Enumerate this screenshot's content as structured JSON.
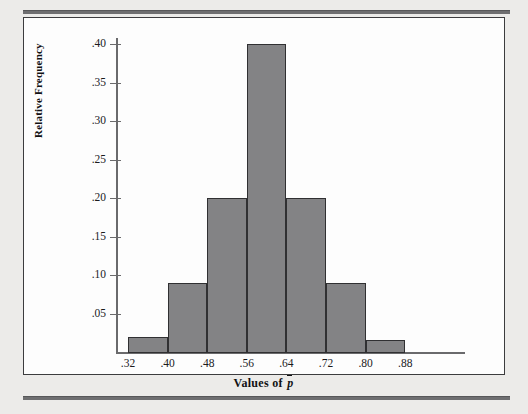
{
  "figure": {
    "panel_background": "#fdfdfd",
    "page_background": "#ecebe9",
    "bar_fill": "#838385",
    "bar_stroke": "#303032",
    "axis_color": "#6a6a6c"
  },
  "chart_data": {
    "type": "bar",
    "title": "",
    "subtitle": "",
    "xlabel": "Values of p̄",
    "ylabel": "Relative Frequency",
    "grid": false,
    "legend": null,
    "xlim": [
      0.24,
      0.92
    ],
    "ylim": [
      0.0,
      0.43
    ],
    "x_tick_labels": [
      ".32",
      ".40",
      ".48",
      ".56",
      ".64",
      ".72",
      ".80",
      ".88"
    ],
    "x_tick_values": [
      0.32,
      0.4,
      0.48,
      0.56,
      0.64,
      0.72,
      0.8,
      0.88
    ],
    "y_tick_labels": [
      ".05",
      ".10",
      ".15",
      ".20",
      ".25",
      ".30",
      ".35",
      ".40"
    ],
    "y_tick_values": [
      0.05,
      0.1,
      0.15,
      0.2,
      0.25,
      0.3,
      0.35,
      0.4
    ],
    "bin_width": 0.08,
    "bins": [
      {
        "left": 0.32,
        "right": 0.4,
        "center": 0.36,
        "value": 0.02
      },
      {
        "left": 0.4,
        "right": 0.48,
        "center": 0.44,
        "value": 0.09
      },
      {
        "left": 0.48,
        "right": 0.56,
        "center": 0.52,
        "value": 0.2
      },
      {
        "left": 0.56,
        "right": 0.64,
        "center": 0.6,
        "value": 0.4
      },
      {
        "left": 0.64,
        "right": 0.72,
        "center": 0.68,
        "value": 0.2
      },
      {
        "left": 0.72,
        "right": 0.8,
        "center": 0.76,
        "value": 0.09
      },
      {
        "left": 0.8,
        "right": 0.88,
        "center": 0.84,
        "value": 0.015
      }
    ],
    "categories": [
      ".32-.40",
      ".40-.48",
      ".48-.56",
      ".56-.64",
      ".64-.72",
      ".72-.80",
      ".80-.88"
    ],
    "values": [
      0.02,
      0.09,
      0.2,
      0.4,
      0.2,
      0.09,
      0.015
    ]
  }
}
